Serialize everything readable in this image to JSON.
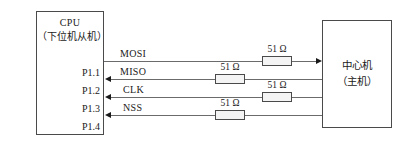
{
  "diagram": {
    "title_hidden": "SPI bus connection between slave CPU and host",
    "cpu_block": {
      "line1": "CPU",
      "line2": "（下位机从机）"
    },
    "host_block": {
      "line1": "中心机",
      "line2": "（主机）"
    },
    "pins": [
      {
        "label": "P1.1",
        "signal": "MOSI",
        "direction": "out",
        "resistor": "51 Ω"
      },
      {
        "label": "P1.2",
        "signal": "MISO",
        "direction": "in",
        "resistor": "51 Ω"
      },
      {
        "label": "P1.3",
        "signal": "CLK",
        "direction": "in",
        "resistor": "51 Ω"
      },
      {
        "label": "P1.4",
        "signal": "NSS",
        "direction": "in",
        "resistor": "51 Ω"
      }
    ],
    "colors": {
      "line": "#6b6b6b",
      "border": "#4a4a4a",
      "text": "#1a1a1a",
      "resistor_fill": "#f4f4f4",
      "background": "#ffffff"
    }
  }
}
